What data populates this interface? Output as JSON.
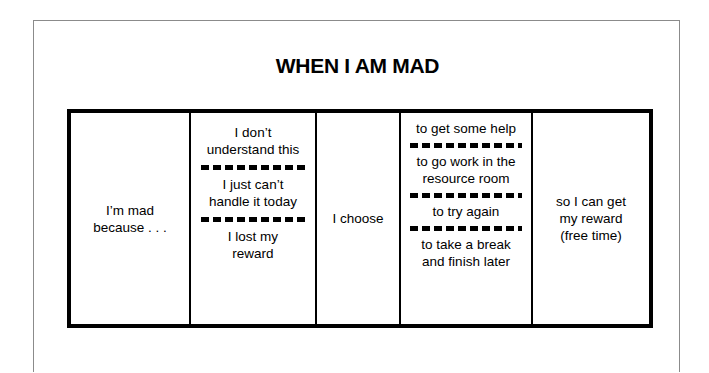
{
  "page": {
    "title": "WHEN I AM MAD",
    "border_color": "#8b8b8b",
    "frame_color": "#000000",
    "background": "#ffffff"
  },
  "strategy_strip": {
    "columns": [
      {
        "name": "trigger-statement",
        "lines": [
          "I’m mad\nbecause . . ."
        ]
      },
      {
        "name": "feeling-options",
        "lines": [
          "I don’t\nunderstand this",
          "I just can’t\nhandle it today",
          "I lost my\nreward"
        ]
      },
      {
        "name": "choice-connector",
        "lines": [
          "I choose"
        ]
      },
      {
        "name": "action-options",
        "lines": [
          "to get some help",
          "to go work in the\nresource room",
          "to try again",
          "to take a break\nand finish later"
        ]
      },
      {
        "name": "reward-outcome",
        "lines": [
          "so I can get\nmy reward\n(free time)"
        ]
      }
    ]
  }
}
